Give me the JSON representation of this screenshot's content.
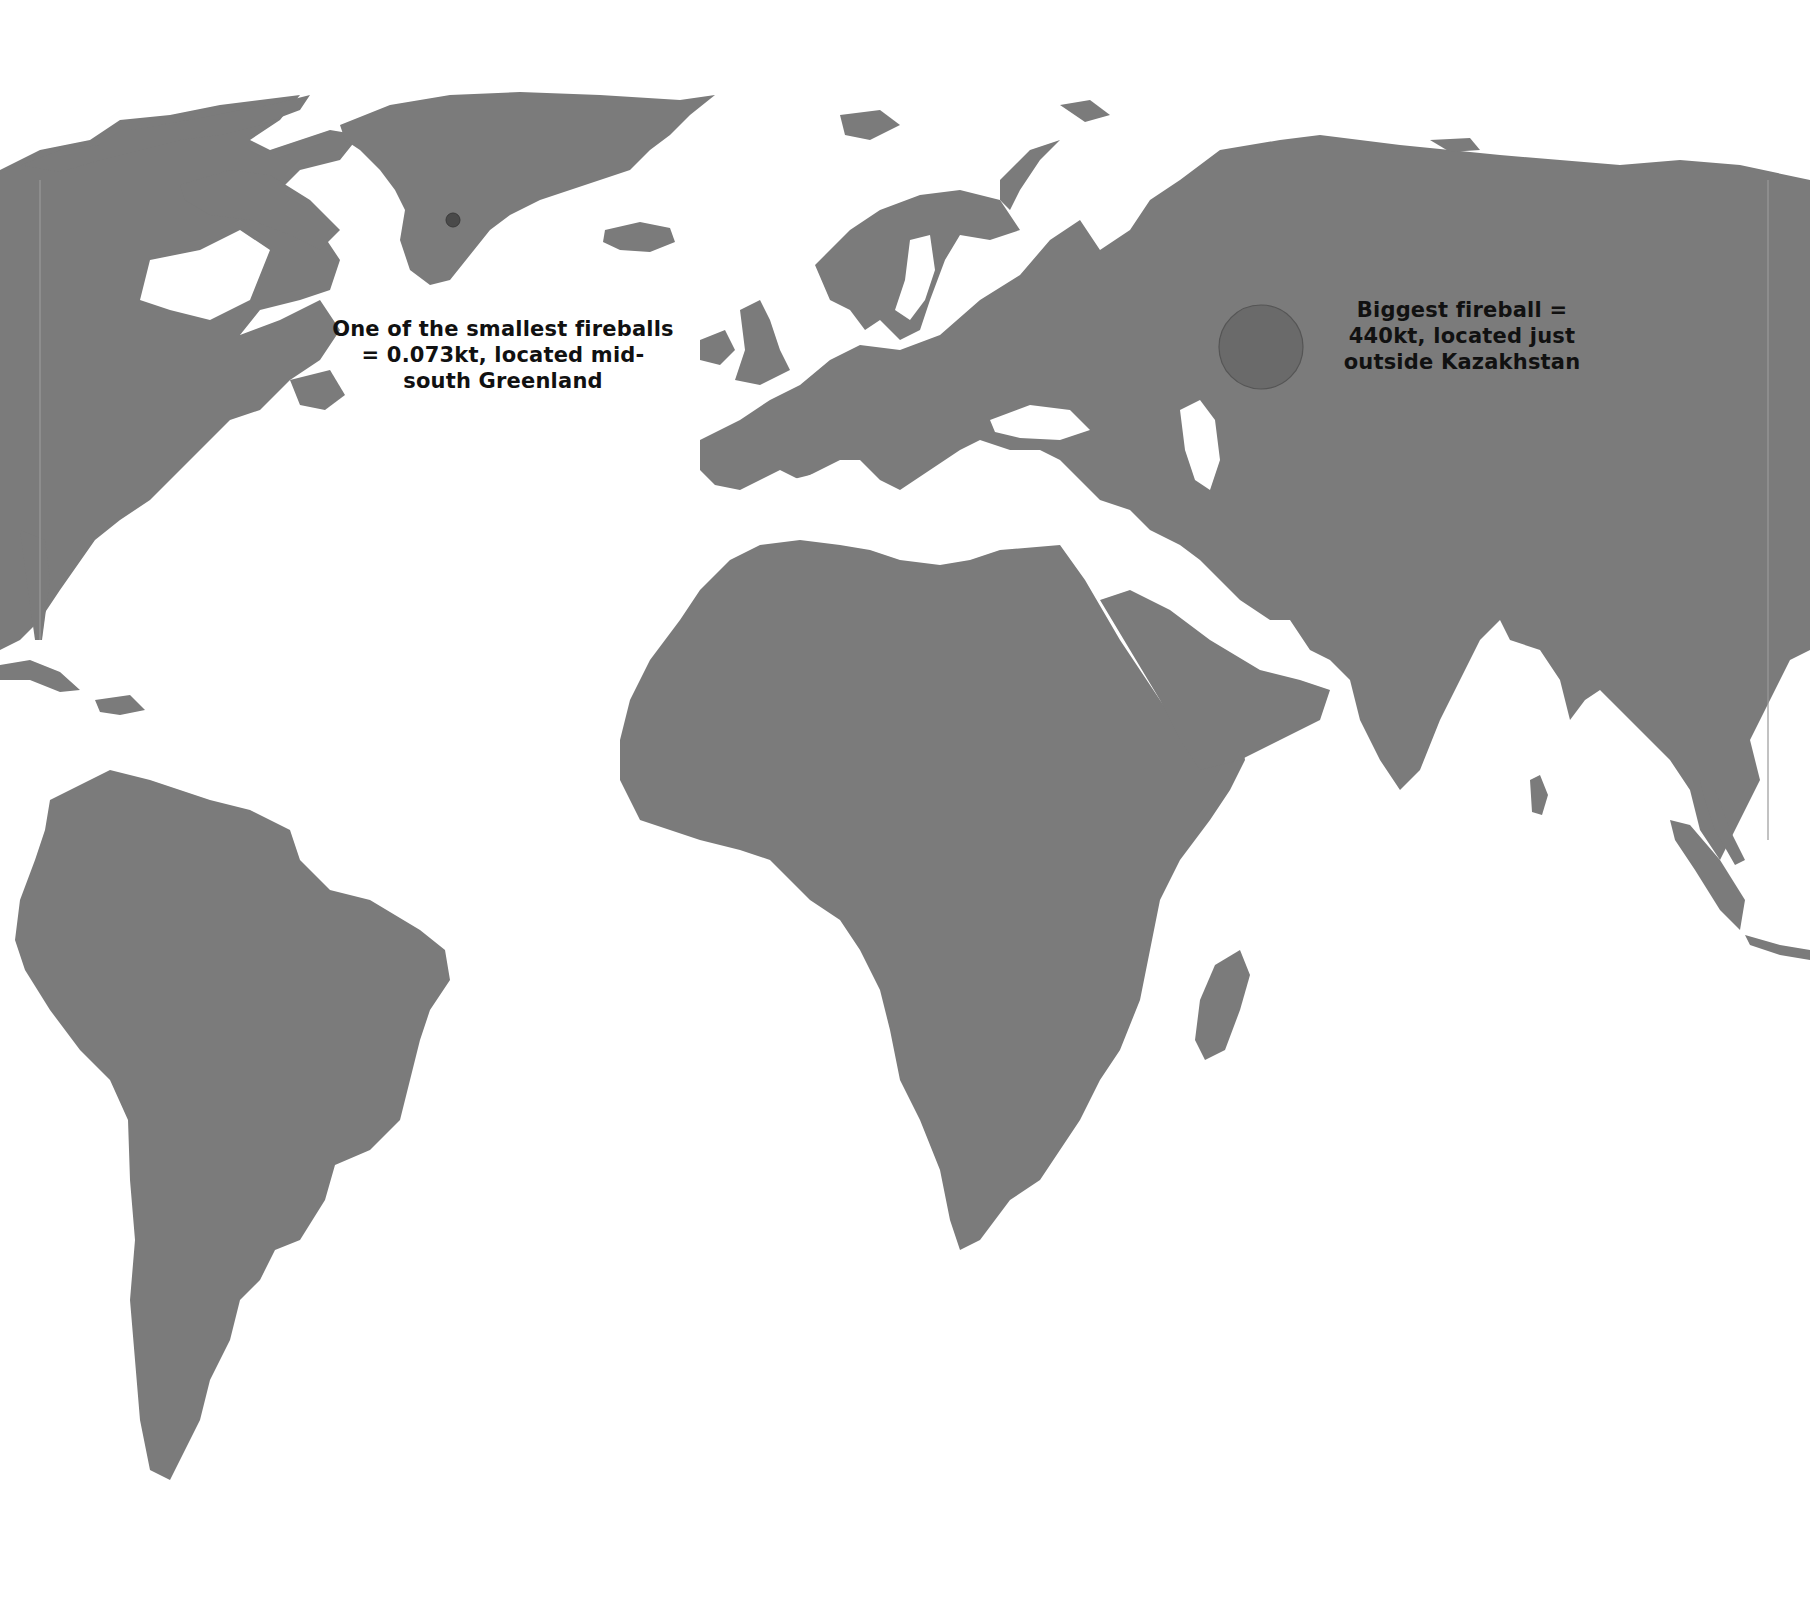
{
  "map": {
    "type": "world-map",
    "projection": "Robinson-like",
    "colors": {
      "land": "#7b7b7b",
      "ocean": "#ffffff",
      "small_fireball": "#4a4a4a",
      "big_fireball": "#6a6a6a",
      "text": "#111111"
    }
  },
  "markers": [
    {
      "id": "smallest-fireball",
      "label_lines": [
        "One of the smallest fireballs",
        "= 0.073kt, located mid-",
        "south Greenland"
      ],
      "energy": "0.073kt",
      "location": "mid-south Greenland",
      "cx": 453,
      "cy": 220,
      "r": 7
    },
    {
      "id": "biggest-fireball",
      "label_lines": [
        "Biggest fireball =",
        "440kt, located just",
        "outside Kazakhstan"
      ],
      "energy": "440kt",
      "location": "just outside Kazakhstan",
      "cx": 1261,
      "cy": 347,
      "r": 42
    }
  ]
}
